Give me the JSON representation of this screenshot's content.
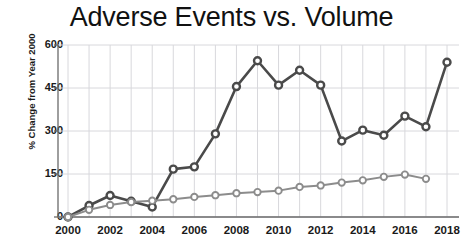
{
  "chart_data": {
    "type": "line",
    "title": "Adverse Events vs. Volume",
    "xlabel": "",
    "ylabel": "% Change from Year 2000",
    "x": [
      2000,
      2001,
      2002,
      2003,
      2004,
      2005,
      2006,
      2007,
      2008,
      2009,
      2010,
      2011,
      2012,
      2013,
      2014,
      2015,
      2016,
      2017,
      2018
    ],
    "xlim": [
      2000,
      2018
    ],
    "ylim": [
      0,
      600
    ],
    "y_ticks": [
      0,
      150,
      300,
      450,
      600
    ],
    "y_tick_labels": [
      "0",
      "150",
      "300",
      "450",
      "600"
    ],
    "x_ticks": [
      2000,
      2002,
      2004,
      2006,
      2008,
      2010,
      2012,
      2014,
      2016,
      2018
    ],
    "x_tick_labels": [
      "2000",
      "2002",
      "2004",
      "2006",
      "2008",
      "2010",
      "2012",
      "2014",
      "2016",
      "2018"
    ],
    "grid": true,
    "legend_position": "none",
    "series": [
      {
        "name": "Adverse Events",
        "color": "#4a4a4a",
        "marker": "circle",
        "values": [
          0,
          40,
          75,
          55,
          35,
          167,
          175,
          290,
          455,
          545,
          460,
          512,
          460,
          265,
          303,
          285,
          352,
          315,
          540
        ]
      },
      {
        "name": "Volume",
        "color": "#8c8c8c",
        "marker": "circle",
        "values": [
          0,
          25,
          42,
          52,
          57,
          62,
          70,
          76,
          83,
          87,
          92,
          105,
          110,
          120,
          128,
          140,
          148,
          133,
          null
        ]
      }
    ]
  },
  "colors": {
    "series_dark": "#4a4a4a",
    "series_light": "#8c8c8c",
    "grid": "#d8d8dc",
    "axis": "#6a6a6a",
    "text": "#1a1a1a",
    "background": "#ffffff"
  }
}
